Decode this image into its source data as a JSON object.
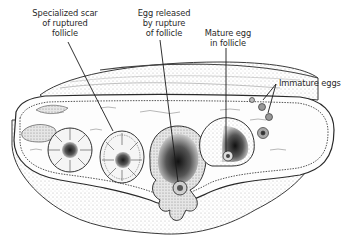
{
  "diagram": {
    "labels": [
      {
        "id": "scar",
        "text": "Specialized scar\nof ruptured\nfollicle",
        "x": 64,
        "y": 8
      },
      {
        "id": "egg_released",
        "text": "Egg released\nby rupture\nof follicle",
        "x": 163,
        "y": 8
      },
      {
        "id": "mature_egg",
        "text": "Mature egg\nin follicle",
        "x": 226,
        "y": 27
      },
      {
        "id": "immature_eggs",
        "text": "Immature eggs",
        "x": 280,
        "y": 80
      }
    ],
    "colors": {
      "ink": "#2a2a2a",
      "shade": "#9a9a9a",
      "background": "#ffffff"
    }
  }
}
